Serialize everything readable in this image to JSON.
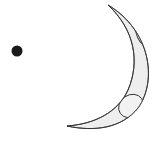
{
  "scene": {
    "width": 161,
    "height": 143,
    "background": "#ffffff",
    "dot": {
      "label": "dot",
      "cx": 17,
      "cy": 51,
      "r": 5.5,
      "color": "#1a1a1a"
    },
    "crescent": {
      "label": "crescent-moon",
      "fill": "#eeeeee",
      "stroke": "#333333",
      "top_tip": [
        108,
        5
      ],
      "bottom_tip": [
        67,
        126
      ],
      "craters": [
        {
          "cx": 141,
          "cy": 36,
          "rx": 5,
          "ry": 11,
          "rotate": -30
        },
        {
          "cx": 130,
          "cy": 106,
          "rx": 13,
          "ry": 11,
          "rotate": -30
        }
      ]
    }
  }
}
